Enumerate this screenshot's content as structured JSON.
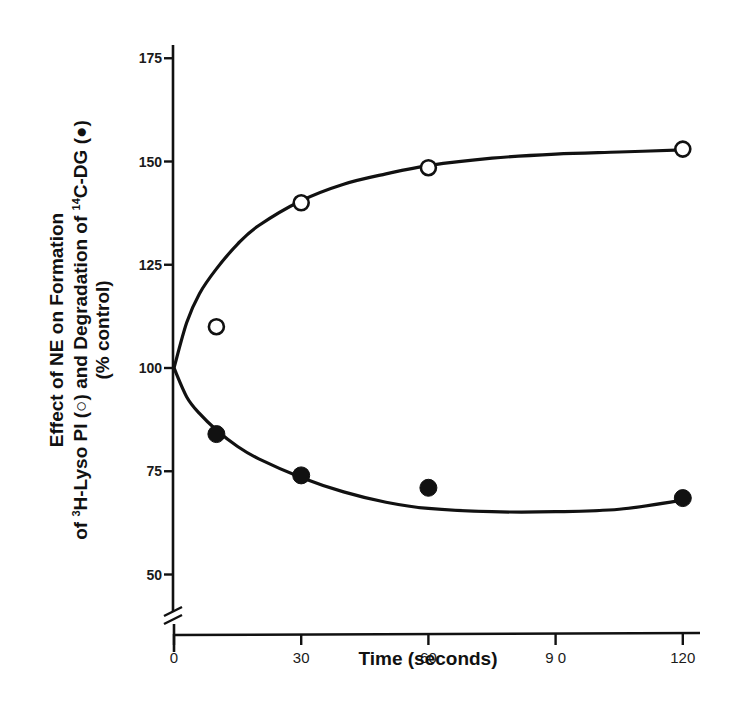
{
  "chart_data": {
    "type": "scatter",
    "title": "",
    "xlabel": "Time (seconds)",
    "ylabel_lines": [
      "Effect of NE on Formation",
      "of ³H-Lyso PI (○) and Degradation of ¹⁴C-DG (●)",
      "(% control)"
    ],
    "ylabel_parts": {
      "line1": "Effect of NE on Formation",
      "line2_a": "of ",
      "line2_sup1": "3",
      "line2_b": "H-Lyso PI (",
      "line2_c": ") and Degradation of ",
      "line2_sup2": "14",
      "line2_d": "C-DG (",
      "line2_e": ")",
      "line3": "(% control)"
    },
    "xlim": [
      0,
      125
    ],
    "ylim": [
      40,
      178
    ],
    "y_axis_break": true,
    "grid": false,
    "legend": "inline in y-axis label",
    "x_ticks": [
      0,
      30,
      60,
      90,
      120
    ],
    "x_tick_labels": [
      "0",
      "30",
      "60",
      "9 0",
      "120"
    ],
    "y_ticks": [
      50,
      75,
      100,
      125,
      150,
      175
    ],
    "y_tick_labels": [
      "50",
      "75",
      "100",
      "125",
      "150",
      "175"
    ],
    "series": [
      {
        "name": "³H-Lyso PI formation",
        "marker": "open-circle",
        "x": [
          10,
          30,
          60,
          120
        ],
        "y": [
          110,
          140,
          148.5,
          153
        ],
        "fit_curve": [
          [
            0,
            100
          ],
          [
            3,
            111
          ],
          [
            6,
            118
          ],
          [
            10,
            124
          ],
          [
            15,
            130
          ],
          [
            20,
            134.5
          ],
          [
            30,
            140.5
          ],
          [
            40,
            144.5
          ],
          [
            50,
            147
          ],
          [
            60,
            149
          ],
          [
            75,
            150.8
          ],
          [
            90,
            151.8
          ],
          [
            105,
            152.3
          ],
          [
            120,
            152.8
          ]
        ]
      },
      {
        "name": "¹⁴C-DG degradation",
        "marker": "filled-circle",
        "x": [
          10,
          30,
          60,
          120
        ],
        "y": [
          84,
          74,
          71,
          68.5
        ],
        "fit_curve": [
          [
            0,
            100
          ],
          [
            3,
            93
          ],
          [
            6,
            89
          ],
          [
            10,
            85
          ],
          [
            15,
            81
          ],
          [
            20,
            78
          ],
          [
            30,
            73.5
          ],
          [
            40,
            70
          ],
          [
            50,
            67.5
          ],
          [
            60,
            66
          ],
          [
            75,
            65.2
          ],
          [
            90,
            65.2
          ],
          [
            105,
            65.8
          ],
          [
            120,
            68
          ]
        ]
      }
    ]
  }
}
